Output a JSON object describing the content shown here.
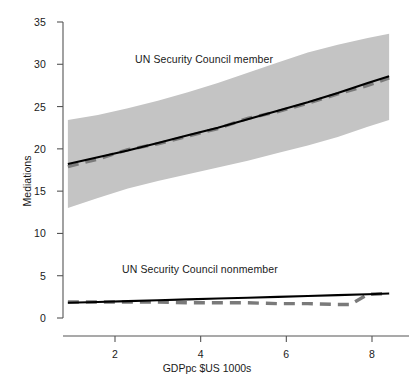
{
  "chart_data": {
    "type": "line",
    "title": "",
    "xlabel": "GDPpc $US 1000s",
    "ylabel": "Mediations",
    "xlim": [
      0.7,
      8.5
    ],
    "ylim": [
      -1.0,
      36.5
    ],
    "xticks": [
      2,
      4,
      6,
      8
    ],
    "yticks": [
      0,
      5,
      10,
      15,
      20,
      25,
      30,
      35
    ],
    "grid": false,
    "legend_position": "inline-annotations",
    "band_color": "#c4c4c4",
    "fit_line_color": "#000000",
    "dashed_line_color": "#7a7a7a",
    "annotations": [
      {
        "text": "UN Security Council member",
        "x": 2.4,
        "y": 30.4
      },
      {
        "text": "UN Security Council nonmember",
        "x": 2.1,
        "y": 5.8
      }
    ],
    "series": [
      {
        "name": "UN Security Council member",
        "style": "solid",
        "x": [
          0.9,
          1.6,
          2.3,
          3.0,
          3.7,
          4.4,
          5.1,
          5.8,
          6.5,
          7.2,
          7.9,
          8.4
        ],
        "values": [
          18.2,
          19.0,
          19.8,
          20.7,
          21.6,
          22.5,
          23.5,
          24.5,
          25.5,
          26.6,
          27.8,
          28.6
        ]
      },
      {
        "name": "UN Security Council member (dashed)",
        "style": "dashed",
        "x": [
          0.9,
          1.6,
          2.3,
          3.0,
          3.7,
          4.4,
          5.1,
          5.8,
          6.5,
          7.2,
          7.9,
          8.4
        ],
        "values": [
          17.9,
          18.8,
          19.9,
          20.6,
          21.5,
          22.4,
          23.6,
          24.4,
          25.4,
          26.5,
          27.5,
          28.4
        ]
      },
      {
        "name": "UN Security Council member (CI upper)",
        "style": "band-upper",
        "x": [
          0.9,
          1.6,
          2.3,
          3.0,
          3.7,
          4.4,
          5.1,
          5.8,
          6.5,
          7.2,
          7.9,
          8.4
        ],
        "values": [
          23.4,
          24.0,
          24.8,
          25.7,
          26.7,
          27.8,
          29.0,
          30.2,
          31.4,
          32.3,
          33.1,
          33.6
        ]
      },
      {
        "name": "UN Security Council member (CI lower)",
        "style": "band-lower",
        "x": [
          0.9,
          1.6,
          2.3,
          3.0,
          3.7,
          4.4,
          5.1,
          5.8,
          6.5,
          7.2,
          7.9,
          8.4
        ],
        "values": [
          13.0,
          14.2,
          15.3,
          16.2,
          17.0,
          17.8,
          18.6,
          19.5,
          20.4,
          21.4,
          22.6,
          23.4
        ]
      },
      {
        "name": "UN Security Council nonmember",
        "style": "solid",
        "x": [
          0.9,
          1.6,
          2.3,
          3.0,
          3.7,
          4.4,
          5.1,
          5.8,
          6.5,
          7.2,
          7.9,
          8.4
        ],
        "values": [
          1.8,
          1.9,
          2.0,
          2.1,
          2.2,
          2.3,
          2.4,
          2.5,
          2.6,
          2.7,
          2.8,
          2.9
        ]
      },
      {
        "name": "UN Security Council nonmember (dashed)",
        "style": "dashed",
        "x": [
          0.9,
          1.6,
          2.3,
          3.0,
          3.7,
          4.4,
          5.1,
          5.8,
          6.5,
          7.2,
          7.5,
          7.9,
          8.4
        ],
        "values": [
          1.9,
          1.9,
          1.9,
          1.9,
          1.8,
          1.8,
          1.8,
          1.7,
          1.7,
          1.6,
          1.6,
          2.8,
          2.9
        ]
      }
    ]
  },
  "axes": {
    "y_title": "Mediations",
    "x_title": "GDPpc $US 1000s",
    "y_tick_labels": [
      "0",
      "5",
      "10",
      "15",
      "20",
      "25",
      "30",
      "35"
    ],
    "x_tick_labels": [
      "2",
      "4",
      "6",
      "8"
    ]
  },
  "annotations": {
    "member_label": "UN Security Council member",
    "nonmember_label": "UN Security Council nonmember"
  }
}
